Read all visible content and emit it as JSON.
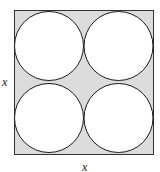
{
  "diagram": {
    "labels": {
      "side_left": "x",
      "side_bottom": "x"
    },
    "colors": {
      "square_fill": "#dcdcdc",
      "circle_fill": "#ffffff",
      "stroke": "#1a1a1a"
    },
    "circle_count": 4
  }
}
